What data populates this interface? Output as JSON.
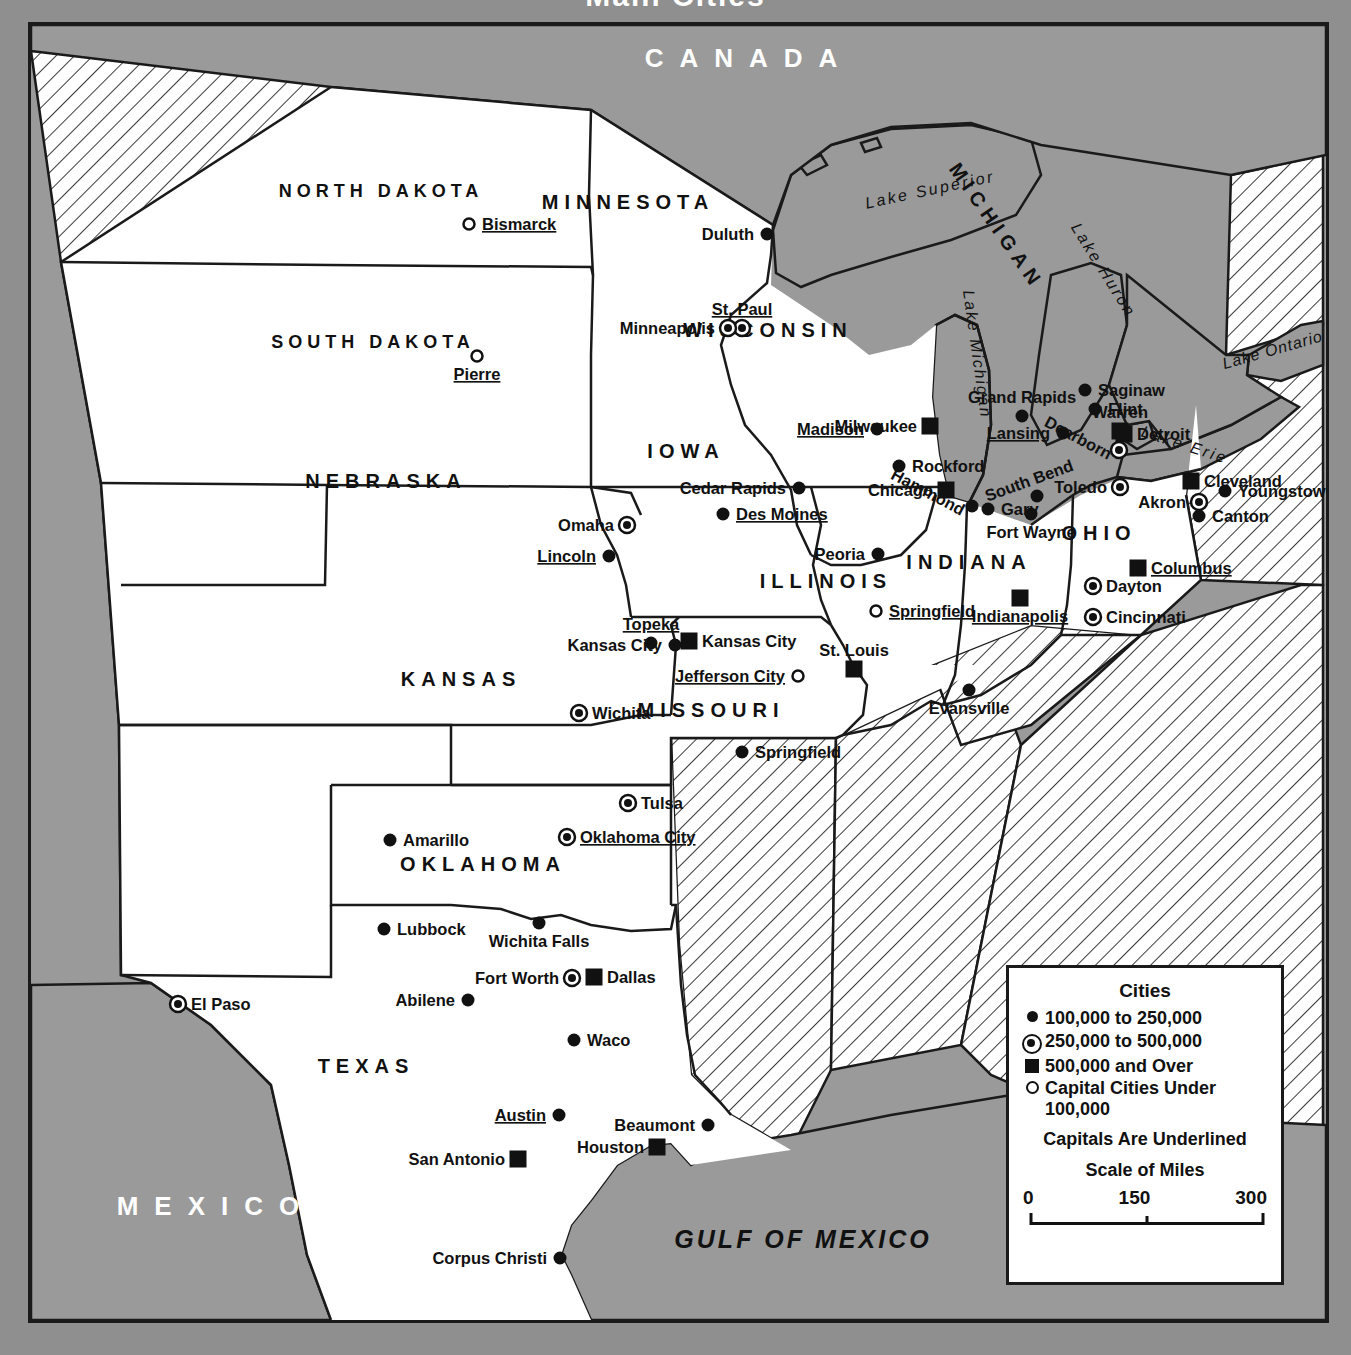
{
  "map": {
    "title": "Main Cities",
    "countries": [
      {
        "name": "CANADA",
        "x": 718,
        "y": 42
      },
      {
        "name": "MEXICO",
        "x": 185,
        "y": 1190
      }
    ],
    "water_labels": [
      {
        "name": "GULF OF MEXICO",
        "x": 772,
        "y": 1223
      },
      {
        "name": "Lake Superior",
        "x": 900,
        "y": 170,
        "rot": -12
      },
      {
        "name": "Lake Huron",
        "x": 1068,
        "y": 248,
        "rot": 58
      },
      {
        "name": "Lake Michigan",
        "x": 941,
        "y": 330,
        "rot": 82
      },
      {
        "name": "Lake Erie",
        "x": 1152,
        "y": 425,
        "rot": 18
      },
      {
        "name": "Lake Ontario",
        "x": 1243,
        "y": 330,
        "rot": -16
      }
    ],
    "states": [
      {
        "name": "NORTH DAKOTA",
        "x": 350,
        "y": 172
      },
      {
        "name": "SOUTH DAKOTA",
        "x": 342,
        "y": 323
      },
      {
        "name": "NEBRASKA",
        "x": 355,
        "y": 463
      },
      {
        "name": "KANSAS",
        "x": 430,
        "y": 661
      },
      {
        "name": "OKLAHOMA",
        "x": 452,
        "y": 846
      },
      {
        "name": "TEXAS",
        "x": 335,
        "y": 1048
      },
      {
        "name": "MINNESOTA",
        "x": 597,
        "y": 184
      },
      {
        "name": "IOWA",
        "x": 655,
        "y": 433
      },
      {
        "name": "MISSOURI",
        "x": 680,
        "y": 692
      },
      {
        "name": "WISCONSIN",
        "x": 737,
        "y": 312
      },
      {
        "name": "ILLINOIS",
        "x": 795,
        "y": 563
      },
      {
        "name": "INDIANA",
        "x": 938,
        "y": 544
      },
      {
        "name": "MICHIGAN",
        "x": 960,
        "y": 205,
        "rot": 55
      },
      {
        "name": "OHIO",
        "x": 1068,
        "y": 515
      }
    ],
    "cities": [
      {
        "name": "Bismarck",
        "type": "capital-small",
        "label_side": "right",
        "cx": 438,
        "cy": 199
      },
      {
        "name": "Pierre",
        "type": "capital-small",
        "label_side": "below",
        "cx": 446,
        "cy": 331
      },
      {
        "name": "Duluth",
        "type": "small",
        "label_side": "left",
        "cx": 736,
        "cy": 209
      },
      {
        "name": "St. Paul",
        "type": "medium",
        "label_side": "above",
        "cx": 711,
        "cy": 303
      },
      {
        "name": "Minneapolis",
        "type": "medium",
        "label_side": "left",
        "cx": 697,
        "cy": 303
      },
      {
        "name": "Omaha",
        "type": "medium",
        "label_side": "left",
        "cx": 596,
        "cy": 500
      },
      {
        "name": "Lincoln",
        "type": "small",
        "label_side": "left",
        "cx": 578,
        "cy": 531
      },
      {
        "name": "Cedar Rapids",
        "type": "small",
        "label_side": "left",
        "cx": 768,
        "cy": 463
      },
      {
        "name": "Des Moines",
        "type": "small",
        "label_side": "right",
        "cx": 692,
        "cy": 489
      },
      {
        "name": "Madison",
        "type": "small",
        "label_side": "left",
        "cx": 846,
        "cy": 404
      },
      {
        "name": "Milwaukee",
        "type": "large",
        "label_side": "left",
        "cx": 899,
        "cy": 401
      },
      {
        "name": "Rockford",
        "type": "small",
        "label_side": "right",
        "cx": 868,
        "cy": 441
      },
      {
        "name": "Chicago",
        "type": "large",
        "label_side": "left",
        "cx": 915,
        "cy": 465
      },
      {
        "name": "Hammond",
        "type": "small",
        "label_side": "left-d",
        "cx": 941,
        "cy": 481
      },
      {
        "name": "Gary",
        "type": "small",
        "label_side": "right",
        "cx": 957,
        "cy": 484
      },
      {
        "name": "Peoria",
        "type": "small",
        "label_side": "left",
        "cx": 847,
        "cy": 529
      },
      {
        "name": "Springfield",
        "type": "capital-small",
        "label_side": "right",
        "cx": 845,
        "cy": 586
      },
      {
        "name": "South Bend",
        "type": "small",
        "label_side": "above-d",
        "cx": 1006,
        "cy": 471
      },
      {
        "name": "Fort Wayne",
        "type": "small",
        "label_side": "below",
        "cx": 1000,
        "cy": 489
      },
      {
        "name": "Indianapolis",
        "type": "large",
        "label_side": "below",
        "cx": 989,
        "cy": 573
      },
      {
        "name": "Evansville",
        "type": "small",
        "label_side": "below",
        "cx": 938,
        "cy": 665
      },
      {
        "name": "Grand Rapids",
        "type": "small",
        "label_side": "above",
        "cx": 991,
        "cy": 391
      },
      {
        "name": "Lansing",
        "type": "small",
        "label_side": "left",
        "cx": 1032,
        "cy": 408
      },
      {
        "name": "Saginaw",
        "type": "small",
        "label_side": "right",
        "cx": 1054,
        "cy": 365
      },
      {
        "name": "Flint",
        "type": "small",
        "label_side": "right",
        "cx": 1064,
        "cy": 384
      },
      {
        "name": "Warren",
        "type": "large",
        "label_side": "above",
        "cx": 1089,
        "cy": 406
      },
      {
        "name": "Detroit",
        "type": "large",
        "label_side": "right",
        "cx": 1093,
        "cy": 409
      },
      {
        "name": "Dearborn",
        "type": "medium",
        "label_side": "left-d",
        "cx": 1088,
        "cy": 425
      },
      {
        "name": "Toledo",
        "type": "medium",
        "label_side": "left",
        "cx": 1089,
        "cy": 462
      },
      {
        "name": "Cleveland",
        "type": "large",
        "label_side": "right",
        "cx": 1160,
        "cy": 456
      },
      {
        "name": "Youngstown",
        "type": "small",
        "label_side": "right",
        "cx": 1194,
        "cy": 466
      },
      {
        "name": "Akron",
        "type": "medium",
        "label_side": "left",
        "cx": 1168,
        "cy": 477
      },
      {
        "name": "Canton",
        "type": "small",
        "label_side": "right",
        "cx": 1168,
        "cy": 491
      },
      {
        "name": "Columbus",
        "type": "large",
        "label_side": "right",
        "cx": 1107,
        "cy": 543
      },
      {
        "name": "Dayton",
        "type": "medium",
        "label_side": "right",
        "cx": 1062,
        "cy": 561
      },
      {
        "name": "Cincinnati",
        "type": "medium",
        "label_side": "right",
        "cx": 1062,
        "cy": 592
      },
      {
        "name": "Topeka",
        "type": "small",
        "label_side": "above",
        "cx": 620,
        "cy": 618
      },
      {
        "name": "Kansas City",
        "type": "small",
        "label_side": "left",
        "cx": 644,
        "cy": 620
      },
      {
        "name": "Kansas City",
        "type": "large",
        "label_side": "right",
        "cx": 658,
        "cy": 616
      },
      {
        "name": "St. Louis",
        "type": "large",
        "label_side": "above",
        "cx": 823,
        "cy": 644
      },
      {
        "name": "Jefferson City",
        "type": "capital-small",
        "label_side": "left",
        "cx": 767,
        "cy": 651
      },
      {
        "name": "Wichita",
        "type": "medium",
        "label_side": "right",
        "cx": 548,
        "cy": 688
      },
      {
        "name": "Springfield",
        "type": "small",
        "label_side": "right",
        "cx": 711,
        "cy": 727
      },
      {
        "name": "Tulsa",
        "type": "medium",
        "label_side": "right",
        "cx": 597,
        "cy": 778
      },
      {
        "name": "Oklahoma City",
        "type": "medium",
        "label_side": "right",
        "cx": 536,
        "cy": 812
      },
      {
        "name": "Amarillo",
        "type": "small",
        "label_side": "right",
        "cx": 359,
        "cy": 815
      },
      {
        "name": "Lubbock",
        "type": "small",
        "label_side": "right",
        "cx": 353,
        "cy": 904
      },
      {
        "name": "Wichita Falls",
        "type": "small",
        "label_side": "below",
        "cx": 508,
        "cy": 898
      },
      {
        "name": "Fort Worth",
        "type": "medium",
        "label_side": "left",
        "cx": 541,
        "cy": 953
      },
      {
        "name": "Dallas",
        "type": "large",
        "label_side": "right",
        "cx": 563,
        "cy": 952
      },
      {
        "name": "Abilene",
        "type": "small",
        "label_side": "left",
        "cx": 437,
        "cy": 975
      },
      {
        "name": "El Paso",
        "type": "medium",
        "label_side": "right",
        "cx": 147,
        "cy": 979
      },
      {
        "name": "Waco",
        "type": "small",
        "label_side": "right",
        "cx": 543,
        "cy": 1015
      },
      {
        "name": "Austin",
        "type": "small",
        "label_side": "left",
        "cx": 528,
        "cy": 1090
      },
      {
        "name": "Beaumont",
        "type": "small",
        "label_side": "left",
        "cx": 677,
        "cy": 1100
      },
      {
        "name": "Houston",
        "type": "large",
        "label_side": "left",
        "cx": 626,
        "cy": 1122
      },
      {
        "name": "San Antonio",
        "type": "large",
        "label_side": "left",
        "cx": 487,
        "cy": 1134
      },
      {
        "name": "Corpus Christi",
        "type": "small",
        "label_side": "left",
        "cx": 529,
        "cy": 1233
      }
    ]
  },
  "legend": {
    "title": "Cities",
    "entries": [
      {
        "symbol": "dot",
        "label": "100,000 to 250,000"
      },
      {
        "symbol": "ring",
        "label": "250,000 to 500,000"
      },
      {
        "symbol": "square",
        "label": "500,000 and Over"
      },
      {
        "symbol": "hollow",
        "label": "Capital Cities Under 100,000"
      }
    ],
    "note": "Capitals Are Underlined",
    "scale_title": "Scale of Miles",
    "scale_ticks": [
      "0",
      "150",
      "300"
    ]
  }
}
